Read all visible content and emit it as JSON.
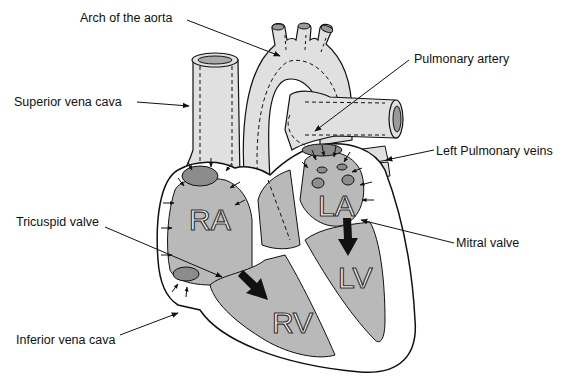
{
  "diagram": {
    "type": "anatomical-heart-cross-section",
    "colors": {
      "background": "#ffffff",
      "tissue_fill": "#e0e0e0",
      "chamber_fill": "#b9b9b9",
      "opening_fill": "#8c8c8c",
      "wall_fill": "#ffffff",
      "outline": "#111111",
      "chamber_label_fill": "#ffffff"
    },
    "labels": {
      "arch_of_aorta": "Arch of the aorta",
      "superior_vena_cava": "Superior vena cava",
      "pulmonary_artery": "Pulmonary artery",
      "left_pulmonary_veins": "Left Pulmonary veins",
      "tricuspid_valve": "Tricuspid valve",
      "mitral_valve": "Mitral valve",
      "inferior_vena_cava": "Inferior vena cava"
    },
    "chambers": {
      "ra": "RA",
      "la": "LA",
      "rv": "RV",
      "lv": "LV"
    }
  }
}
